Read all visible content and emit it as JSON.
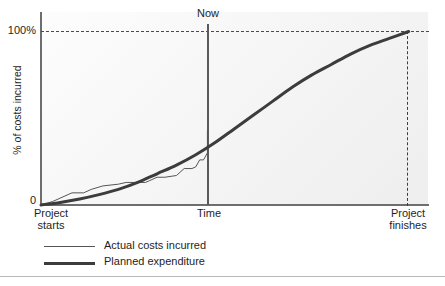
{
  "chart_data": {
    "type": "line",
    "title": "",
    "xlabel": "Time",
    "ylabel": "% of costs incurred",
    "ylim": [
      0,
      100
    ],
    "xlim": [
      0,
      100
    ],
    "grid": false,
    "legend_position": "below-plot-left",
    "y_ticks": [
      "0",
      "100%"
    ],
    "x_annotations": [
      {
        "name": "project-starts",
        "line1": "Project",
        "line2": "starts",
        "x": 0
      },
      {
        "name": "time-axis-title",
        "line1": "Time",
        "line2": "",
        "x": 43
      },
      {
        "name": "project-finishes",
        "line1": "Project",
        "line2": "finishes",
        "x": 95
      }
    ],
    "annotations": [
      {
        "name": "now-marker",
        "label": "Now",
        "x": 43,
        "type": "vertical-line"
      },
      {
        "name": "completion-gridline",
        "label": "100%",
        "y": 100,
        "type": "horizontal-dashed-line"
      },
      {
        "name": "finish-marker",
        "label": "",
        "x": 95,
        "type": "vertical-dashed-line"
      }
    ],
    "series": [
      {
        "name": "Actual costs incurred",
        "style": "thin-step",
        "color": "#555555",
        "points": [
          [
            0,
            0
          ],
          [
            3,
            2
          ],
          [
            7,
            6
          ],
          [
            8,
            7
          ],
          [
            11,
            7
          ],
          [
            13,
            9
          ],
          [
            16,
            11
          ],
          [
            20,
            12
          ],
          [
            22,
            13
          ],
          [
            27,
            13
          ],
          [
            28,
            14
          ],
          [
            30,
            16
          ],
          [
            32,
            16
          ],
          [
            35,
            17
          ],
          [
            37,
            21
          ],
          [
            39,
            21
          ],
          [
            40,
            22
          ],
          [
            41,
            26
          ],
          [
            42,
            26
          ],
          [
            43,
            30
          ],
          [
            43,
            33
          ],
          [
            43,
            43
          ]
        ]
      },
      {
        "name": "Planned expenditure",
        "style": "thick-s-curve",
        "color": "#3c3c3c",
        "points": [
          [
            0,
            0
          ],
          [
            5,
            1.5
          ],
          [
            10,
            3.5
          ],
          [
            15,
            6
          ],
          [
            20,
            9
          ],
          [
            25,
            13
          ],
          [
            30,
            18
          ],
          [
            35,
            23
          ],
          [
            40,
            29
          ],
          [
            45,
            36
          ],
          [
            50,
            44
          ],
          [
            55,
            52
          ],
          [
            60,
            60
          ],
          [
            65,
            68
          ],
          [
            70,
            75
          ],
          [
            75,
            81
          ],
          [
            80,
            87
          ],
          [
            85,
            92
          ],
          [
            90,
            96
          ],
          [
            95,
            100
          ]
        ]
      }
    ]
  },
  "axes": {
    "y_top_label": "100%",
    "y_zero_label": "0",
    "y_axis_title": "% of costs incurred",
    "x_axis_title": "Time"
  },
  "markers": {
    "now_label": "Now",
    "project_start_line1": "Project",
    "project_start_line2": "starts",
    "project_finish_line1": "Project",
    "project_finish_line2": "finishes"
  },
  "legend": {
    "items": [
      {
        "label": "Actual costs incurred",
        "style": "thin"
      },
      {
        "label": "Planned expenditure",
        "style": "thick"
      }
    ]
  },
  "colors": {
    "actual_line": "#555555",
    "planned_line": "#3c3c3c",
    "axis": "#6e6e6e",
    "now_line": "#5a5a5a",
    "dashed": "#3d3d3d",
    "plot_background": "#f5f5f5",
    "page_background": "#ffffff"
  }
}
